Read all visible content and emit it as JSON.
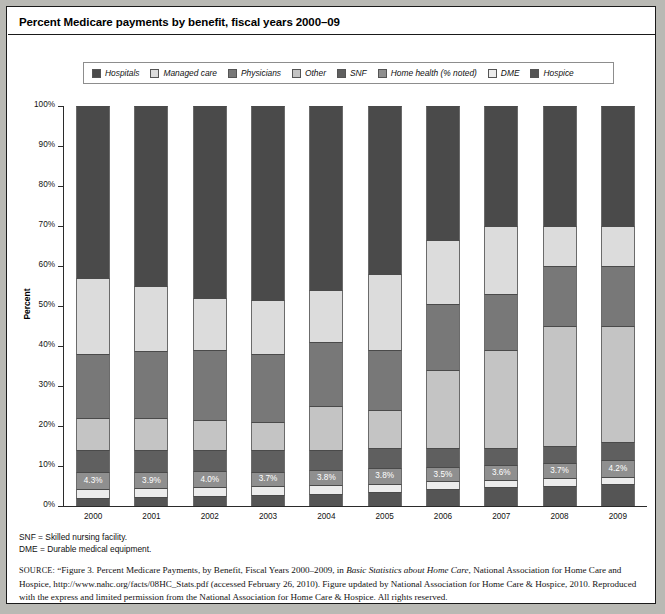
{
  "figure": {
    "title": "Percent Medicare payments by benefit, fiscal years 2000–09"
  },
  "legend": {
    "items": [
      {
        "label": "Hospitals",
        "color": "#4a4a4a"
      },
      {
        "label": "Managed care",
        "color": "#dcdcdc"
      },
      {
        "label": "Physicians",
        "color": "#787878"
      },
      {
        "label": "Other",
        "color": "#c4c4c4"
      },
      {
        "label": "SNF",
        "color": "#5f5f5f"
      },
      {
        "label": "Home health (% noted)",
        "color": "#8f8f8f"
      },
      {
        "label": "DME",
        "color": "#ececec"
      },
      {
        "label": "Hospice",
        "color": "#555555"
      }
    ]
  },
  "axes": {
    "y_title": "Percent",
    "y_ticks": [
      "100%",
      "90%",
      "80%",
      "70%",
      "60%",
      "50%",
      "40%",
      "30%",
      "20%",
      "10%",
      "0%"
    ]
  },
  "notes": {
    "line1": "SNF = Skilled nursing facility.",
    "line2": "DME = Durable medical equipment."
  },
  "source": {
    "prefix": "SOURCE:",
    "part1": " “Figure 3. Percent Medicare Payments, by Benefit, Fiscal Years 2000–2009, in ",
    "italic1": "Basic Statistics about Home Care",
    "part2": ", National Association for Home Care and Hospice, http://www.nahc.org/facts/08HC_Stats.pdf (accessed February 26, 2010). Figure updated by National Association for Home Care & Hospice, 2010. Reproduced with the express and limited permission from the National Association for Home Care & Hospice. All rights reserved."
  },
  "chart_data": {
    "type": "bar",
    "stacked": true,
    "normalized_percent": true,
    "title": "Percent Medicare payments by benefit, fiscal years 2000–09",
    "xlabel": "",
    "ylabel": "Percent",
    "ylim": [
      0,
      100
    ],
    "grid": false,
    "legend_position": "top",
    "categories": [
      "2000",
      "2001",
      "2002",
      "2003",
      "2004",
      "2005",
      "2006",
      "2007",
      "2008",
      "2009"
    ],
    "stack_order_bottom_to_top": [
      "Hospice",
      "DME",
      "Home health (% noted)",
      "SNF",
      "Other",
      "Physicians",
      "Managed care",
      "Hospitals"
    ],
    "series": [
      {
        "name": "Hospice",
        "color": "#555555",
        "values": [
          2.0,
          2.2,
          2.5,
          2.7,
          3.1,
          3.6,
          4.2,
          4.7,
          5.1,
          5.4
        ]
      },
      {
        "name": "DME",
        "color": "#ececec",
        "values": [
          2.3,
          2.3,
          2.2,
          2.2,
          2.1,
          2.0,
          2.0,
          1.9,
          1.9,
          1.8
        ]
      },
      {
        "name": "Home health (% noted)",
        "color": "#8f8f8f",
        "values": [
          4.3,
          3.9,
          4.0,
          3.7,
          3.8,
          3.8,
          3.5,
          3.6,
          3.7,
          4.2
        ],
        "data_labels": [
          "4.3%",
          "3.9%",
          "4.0%",
          "3.7%",
          "3.8%",
          "3.8%",
          "3.5%",
          "3.6%",
          "3.7%",
          "4.2%"
        ]
      },
      {
        "name": "SNF",
        "color": "#5f5f5f",
        "values": [
          5.4,
          5.6,
          5.3,
          5.4,
          5.0,
          5.1,
          4.8,
          4.3,
          4.3,
          4.6
        ]
      },
      {
        "name": "Other",
        "color": "#c4c4c4",
        "values": [
          8.0,
          8.0,
          7.5,
          7.0,
          11.0,
          9.5,
          19.5,
          24.5,
          30.0,
          29.0
        ]
      },
      {
        "name": "Physicians",
        "color": "#787878",
        "values": [
          16.0,
          16.8,
          17.5,
          17.0,
          16.0,
          15.0,
          16.5,
          14.0,
          15.0,
          15.0
        ]
      },
      {
        "name": "Managed care",
        "color": "#dcdcdc",
        "values": [
          19.0,
          16.2,
          13.0,
          13.5,
          13.0,
          19.0,
          16.0,
          17.0,
          10.0,
          10.0
        ]
      },
      {
        "name": "Hospitals",
        "color": "#4a4a4a",
        "values": [
          43.0,
          45.0,
          48.0,
          48.5,
          46.0,
          42.0,
          33.5,
          30.0,
          30.0,
          30.0
        ]
      }
    ]
  }
}
